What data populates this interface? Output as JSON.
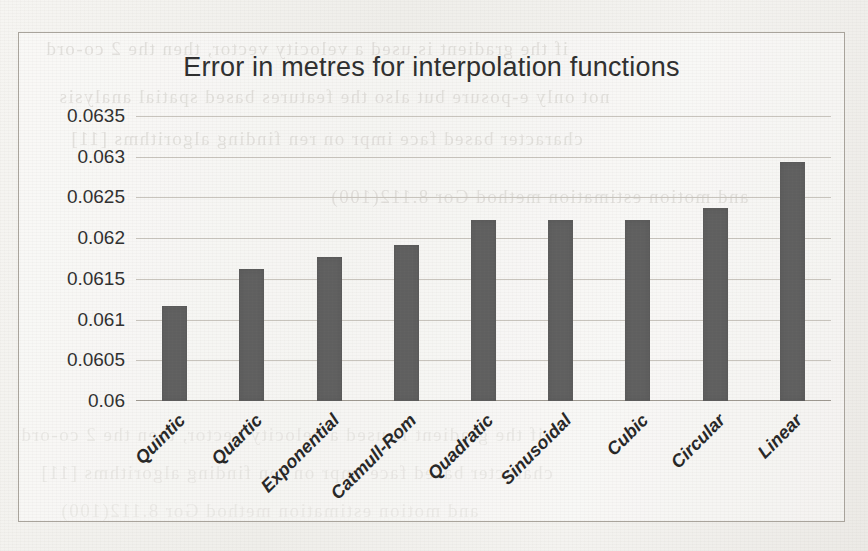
{
  "chart_data": {
    "type": "bar",
    "title": "Error in metres for interpolation functions",
    "xlabel": "",
    "ylabel": "",
    "categories": [
      "Quintic",
      "Quartic",
      "Exponential",
      "Catmull-Rom",
      "Quadratic",
      "Sinusoidal",
      "Cubic",
      "Circular",
      "Linear"
    ],
    "values": [
      0.06117,
      0.06162,
      0.06177,
      0.06192,
      0.06222,
      0.06222,
      0.06222,
      0.06237,
      0.06293
    ],
    "ylim": [
      0.06,
      0.0635
    ],
    "yticks": [
      "0.06",
      "0.0605",
      "0.061",
      "0.0615",
      "0.062",
      "0.0625",
      "0.063",
      "0.0635"
    ],
    "ytick_values": [
      0.06,
      0.0605,
      0.061,
      0.0615,
      0.062,
      0.0625,
      0.063,
      0.0635
    ],
    "grid": true,
    "legend": "none",
    "bar_color": "#5f5f5f",
    "gridline_color": "#c8c4bd",
    "series": [
      {
        "name": "Error in metres",
        "values": [
          0.06117,
          0.06162,
          0.06177,
          0.06192,
          0.06222,
          0.06222,
          0.06222,
          0.06237,
          0.06293
        ]
      }
    ]
  },
  "page": {
    "background_note": "scanned paper with faint mirrored bleed-through text from reverse page",
    "ghost_text": [
      "if the gradient is used a velocity vector, then the 2 co-ord",
      "not only e-posure but also the features based spatial analysis",
      "character based face impr on ren finding algorithms [11]",
      "and motion estimation method Gor 8.112(100)"
    ]
  }
}
